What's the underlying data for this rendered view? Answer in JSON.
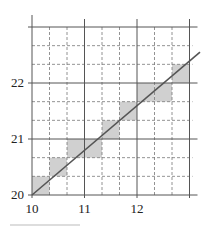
{
  "diagram": {
    "type": "grid-staircase",
    "x_ticks": [
      {
        "value": 10,
        "label": "10"
      },
      {
        "value": 11,
        "label": "11"
      },
      {
        "value": 12,
        "label": "12"
      }
    ],
    "y_ticks": [
      {
        "value": 20,
        "label": "20"
      },
      {
        "value": 21,
        "label": "21"
      },
      {
        "value": 22,
        "label": "22"
      }
    ],
    "x_range": [
      10,
      13
    ],
    "y_range": [
      20,
      23
    ],
    "minor_subdivision": 3,
    "line": {
      "from": [
        10,
        20
      ],
      "to": [
        13.2,
        22.55
      ],
      "color": "#555555"
    },
    "shaded_cells": [
      [
        0,
        0
      ],
      [
        1,
        1
      ],
      [
        2,
        2
      ],
      [
        3,
        2
      ],
      [
        4,
        3
      ],
      [
        5,
        4
      ],
      [
        6,
        5
      ],
      [
        7,
        5
      ],
      [
        8,
        6
      ]
    ],
    "shade_color": "#d0d0d0",
    "grid_color": "#555555"
  }
}
